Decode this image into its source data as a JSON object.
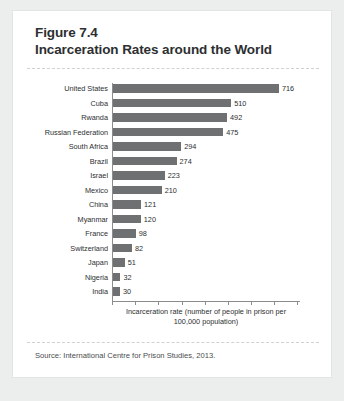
{
  "figure": {
    "number_line": "Figure 7.4",
    "title_line": "Incarceration Rates around the World",
    "source": "Source: International Centre for Prison Studies, 2013."
  },
  "chart_data": {
    "type": "bar",
    "orientation": "horizontal",
    "title": "Incarceration Rates around the World",
    "xlabel": "Incarceration rate (number of people in prison per 100,000 population)",
    "ylabel": "",
    "xlim": [
      0,
      800
    ],
    "grid": false,
    "legend": null,
    "bar_color": "#6e7072",
    "categories": [
      "United States",
      "Cuba",
      "Rwanda",
      "Russian Federation",
      "South Africa",
      "Brazil",
      "Israel",
      "Mexico",
      "China",
      "Myanmar",
      "France",
      "Switzerland",
      "Japan",
      "Nigeria",
      "India"
    ],
    "values": [
      716,
      510,
      492,
      475,
      294,
      274,
      223,
      210,
      121,
      120,
      98,
      82,
      51,
      32,
      30
    ],
    "tick_positions": [
      0,
      100,
      200,
      300,
      400,
      500,
      600,
      700,
      800
    ],
    "tick_labels": [
      "",
      "",
      "",
      "",
      "",
      "",
      "",
      "",
      ""
    ]
  }
}
